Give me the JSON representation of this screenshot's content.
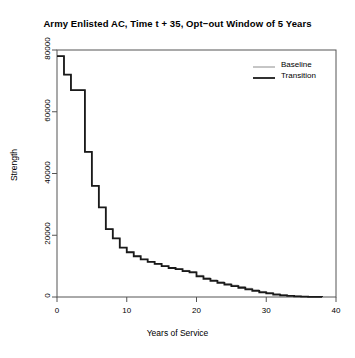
{
  "chart_data": {
    "type": "line",
    "title": "Army Enlisted AC, Time t + 35, Opt−out Window of 5 Years",
    "xlabel": "Years of Service",
    "ylabel": "Strength",
    "xlim": [
      0,
      40
    ],
    "ylim": [
      0,
      80000
    ],
    "xticks": [
      0,
      10,
      20,
      30,
      40
    ],
    "yticks": [
      0,
      20000,
      40000,
      60000,
      80000
    ],
    "xtick_labels": [
      "0",
      "10",
      "20",
      "30",
      "40"
    ],
    "ytick_labels": [
      "0",
      "20000",
      "40000",
      "60000",
      "80000"
    ],
    "grid": false,
    "step_style": "hv",
    "legend": {
      "position": "top-right",
      "entries": [
        {
          "label": "Baseline",
          "color": "#8c8c8c",
          "width": 1.0
        },
        {
          "label": "Transition",
          "color": "#1a1a1a",
          "width": 1.8
        }
      ]
    },
    "x": [
      0,
      1,
      2,
      3,
      4,
      5,
      6,
      7,
      8,
      9,
      10,
      11,
      12,
      13,
      14,
      15,
      16,
      17,
      18,
      19,
      20,
      21,
      22,
      23,
      24,
      25,
      26,
      27,
      28,
      29,
      30,
      31,
      32,
      33,
      34,
      35,
      36,
      37,
      38
    ],
    "series": [
      {
        "name": "Baseline",
        "color": "#8c8c8c",
        "values": [
          78000,
          72000,
          67000,
          67000,
          47000,
          36000,
          29000,
          22000,
          19000,
          16000,
          14500,
          13200,
          12200,
          11400,
          10700,
          10000,
          9400,
          9000,
          8600,
          8200,
          7000,
          6200,
          5500,
          4900,
          4300,
          3800,
          3300,
          2800,
          2300,
          1800,
          1400,
          1000,
          700,
          450,
          280,
          160,
          80,
          30,
          0
        ]
      },
      {
        "name": "Transition",
        "color": "#1a1a1a",
        "values": [
          78000,
          72000,
          67000,
          67000,
          47000,
          36000,
          29000,
          22000,
          19000,
          16000,
          14500,
          13200,
          12200,
          11400,
          10700,
          10000,
          9400,
          9000,
          8400,
          8000,
          6700,
          5900,
          5200,
          4600,
          4000,
          3500,
          3000,
          2500,
          2000,
          1500,
          1150,
          800,
          550,
          350,
          200,
          110,
          50,
          20,
          0
        ]
      }
    ]
  }
}
